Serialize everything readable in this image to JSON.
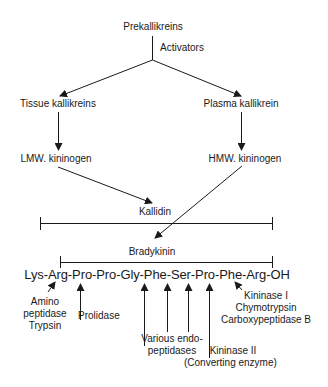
{
  "nodes": {
    "prekallikreins": "Prekallikreins",
    "activators": "Activators",
    "tissue_kallikreins": "Tissue kallikreins",
    "plasma_kallikrein": "Plasma kallikrein",
    "lmw_kininogen": "LMW. kininogen",
    "hmw_kininogen": "HMW. kininogen",
    "kallidin": "Kallidin",
    "bradykinin": "Bradykinin"
  },
  "sequence": "Lys-Arg-Pro-Pro-Gly-Phe-Ser-Pro-Phe-Arg-OH",
  "enzymes": {
    "aminopeptidase": [
      "Amino",
      "peptidase",
      "Trypsin"
    ],
    "prolidase": "Prolidase",
    "endopeptidases": [
      "Various endo-",
      "peptidases"
    ],
    "kininase_ii": [
      "Kininase II",
      "(Converting enzyme)"
    ],
    "kininase_i": [
      "Kininase I",
      "Chymotrypsin",
      "Carboxypeptidase B"
    ]
  },
  "colors": {
    "line": "#1a1a1a",
    "background": "#ffffff"
  }
}
